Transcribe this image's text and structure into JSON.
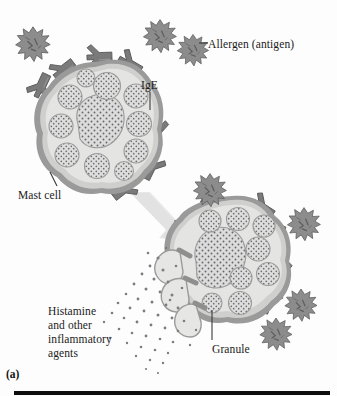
{
  "figure": {
    "panel_letter": "(a)",
    "topic": "mast-cell-degranulation-allergic-reaction",
    "background_color": "#fdfdfd"
  },
  "labels": {
    "allergen": "Allergen (antigen)",
    "ige": "IgE",
    "mast_cell": "Mast cell",
    "histamine": "Histamine\nand other\ninflammatory\nagents",
    "granule": "Granule"
  },
  "colors": {
    "allergen_fill": "#8c8c8c",
    "allergen_stroke": "#5c5c5c",
    "antibody_fill": "#7a7a7a",
    "antibody_stroke": "#5a5a5a",
    "cell_cytoplasm": "#e3e3e1",
    "cell_membrane_outer": "#9a9a9a",
    "cell_membrane_inner": "#cfcfcd",
    "granule_fill": "#dedede",
    "granule_stroke": "#9b9b9b",
    "stipple_dot": "#6f6f6f",
    "arrow_fill": "#e6e6e6",
    "leader_line": "#3a3a3a",
    "rule": "#0d0d0d",
    "text": "#1b1b1b"
  },
  "icons": {
    "allergen": "spiky-allergen-particle-icon",
    "antibody": "y-shaped-ige-antibody-icon",
    "granule": "stippled-granule-icon",
    "arrow": "process-arrow-icon",
    "secretion": "histamine-dot-spray-icon"
  },
  "scene": {
    "resting_cell": {
      "name": "resting-mast-cell",
      "center": [
        107,
        131
      ],
      "granule_count": 11,
      "has_large_central_granule": true
    },
    "activated_cell": {
      "name": "activated-mast-cell",
      "center": [
        232,
        265
      ],
      "granule_count": 10,
      "degranulating": true,
      "open_pores": 3
    },
    "free_allergens": [
      {
        "cx": 160,
        "cy": 36,
        "r": 16
      },
      {
        "cx": 192,
        "cy": 50,
        "r": 15
      }
    ],
    "bound_allergens": [
      {
        "cx": 33,
        "cy": 44,
        "r": 17
      },
      {
        "cx": 210,
        "cy": 190,
        "r": 16
      },
      {
        "cx": 303,
        "cy": 225,
        "r": 16
      },
      {
        "cx": 300,
        "cy": 305,
        "r": 15
      },
      {
        "cx": 276,
        "cy": 334,
        "r": 15
      }
    ],
    "arrow": {
      "from": [
        132,
        196
      ],
      "to": [
        178,
        235
      ]
    }
  }
}
